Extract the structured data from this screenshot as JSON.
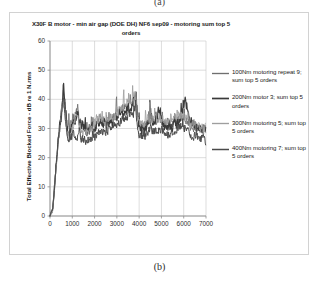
{
  "figure": {
    "caption_top": "(a)",
    "caption_bottom": "(b)"
  },
  "chart_data": {
    "type": "line",
    "title": "X30F B motor - min air gap (DOE DH) NF6 sep09 - motoring sum top 5 orders",
    "title_line1": "X30F B motor - min air gap (DOE DH) NF6 sep09 - motoring",
    "title_line2": "sum top 5 orders",
    "xlabel": "",
    "ylabel": "Total Effective Blocked Force - dB re 1 N.rms",
    "xlim": [
      0,
      7000
    ],
    "ylim": [
      0,
      60
    ],
    "xticks": [
      "0",
      "1000",
      "2000",
      "3000",
      "4000",
      "5000",
      "6000",
      "7000"
    ],
    "yticks": [
      "0",
      "10",
      "20",
      "30",
      "40",
      "50",
      "60"
    ],
    "xtick_values": [
      0,
      1000,
      2000,
      3000,
      4000,
      5000,
      6000,
      7000
    ],
    "ytick_values": [
      0,
      10,
      20,
      30,
      40,
      50,
      60
    ],
    "grid": true,
    "legend_position": "right",
    "series": [
      {
        "name": "100Nm motoring repeat 9; sum top 5 orders",
        "color": "#6f6f6f",
        "width": 0.85,
        "seed": 11,
        "baseline": [
          [
            0,
            0
          ],
          [
            120,
            2
          ],
          [
            200,
            9
          ],
          [
            260,
            16
          ],
          [
            330,
            22
          ],
          [
            420,
            29
          ],
          [
            520,
            36
          ],
          [
            600,
            43
          ],
          [
            680,
            36
          ],
          [
            780,
            31
          ],
          [
            900,
            30
          ],
          [
            1050,
            33
          ],
          [
            1200,
            36
          ],
          [
            1350,
            33
          ],
          [
            1500,
            31
          ],
          [
            1700,
            30
          ],
          [
            1900,
            31
          ],
          [
            2100,
            32
          ],
          [
            2300,
            33
          ],
          [
            2500,
            32
          ],
          [
            2700,
            33
          ],
          [
            2900,
            34
          ],
          [
            3100,
            36
          ],
          [
            3300,
            37
          ],
          [
            3500,
            38
          ],
          [
            3700,
            39
          ],
          [
            3850,
            40
          ],
          [
            3950,
            33
          ],
          [
            4100,
            30
          ],
          [
            4300,
            31
          ],
          [
            4500,
            33
          ],
          [
            4700,
            32
          ],
          [
            4900,
            33
          ],
          [
            5100,
            32
          ],
          [
            5300,
            31
          ],
          [
            5500,
            32
          ],
          [
            5700,
            33
          ],
          [
            5900,
            34
          ],
          [
            6050,
            33
          ],
          [
            6300,
            31
          ],
          [
            6600,
            30
          ],
          [
            6900,
            29
          ],
          [
            7000,
            29
          ]
        ],
        "noise": 1.5
      },
      {
        "name": "200Nm motor 3; sum top 5 orders",
        "color": "#3a3a3a",
        "width": 1.2,
        "seed": 27,
        "baseline": [
          [
            0,
            0
          ],
          [
            130,
            3
          ],
          [
            210,
            11
          ],
          [
            280,
            18
          ],
          [
            350,
            24
          ],
          [
            440,
            31
          ],
          [
            540,
            38
          ],
          [
            610,
            46
          ],
          [
            690,
            37
          ],
          [
            790,
            30
          ],
          [
            910,
            29
          ],
          [
            1060,
            32
          ],
          [
            1210,
            35
          ],
          [
            1360,
            32
          ],
          [
            1510,
            30
          ],
          [
            1710,
            29
          ],
          [
            1910,
            30
          ],
          [
            2110,
            31
          ],
          [
            2310,
            32
          ],
          [
            2510,
            31
          ],
          [
            2710,
            32
          ],
          [
            2910,
            33
          ],
          [
            3110,
            35
          ],
          [
            3310,
            36
          ],
          [
            3510,
            37
          ],
          [
            3710,
            38
          ],
          [
            3860,
            41
          ],
          [
            3960,
            32
          ],
          [
            4110,
            29
          ],
          [
            4310,
            30
          ],
          [
            4510,
            35
          ],
          [
            4710,
            31
          ],
          [
            4910,
            37
          ],
          [
            5110,
            31
          ],
          [
            5310,
            30
          ],
          [
            5510,
            31
          ],
          [
            5710,
            32
          ],
          [
            5910,
            34
          ],
          [
            6060,
            40
          ],
          [
            6310,
            32
          ],
          [
            6610,
            31
          ],
          [
            6910,
            30
          ],
          [
            7000,
            29
          ]
        ],
        "noise": 1.7
      },
      {
        "name": "300Nm motoring 5; sum top 5 orders",
        "color": "#9e9e9e",
        "width": 0.85,
        "seed": 43,
        "baseline": [
          [
            0,
            0
          ],
          [
            115,
            2
          ],
          [
            195,
            8
          ],
          [
            255,
            15
          ],
          [
            325,
            21
          ],
          [
            415,
            28
          ],
          [
            515,
            34
          ],
          [
            595,
            40
          ],
          [
            675,
            35
          ],
          [
            775,
            27
          ],
          [
            895,
            27
          ],
          [
            1045,
            31
          ],
          [
            1195,
            34
          ],
          [
            1345,
            31
          ],
          [
            1495,
            28
          ],
          [
            1695,
            28
          ],
          [
            1895,
            30
          ],
          [
            2095,
            33
          ],
          [
            2295,
            34
          ],
          [
            2495,
            32
          ],
          [
            2695,
            33
          ],
          [
            2895,
            34
          ],
          [
            3095,
            36
          ],
          [
            3295,
            38
          ],
          [
            3495,
            39
          ],
          [
            3695,
            40
          ],
          [
            3845,
            42
          ],
          [
            3945,
            34
          ],
          [
            4095,
            31
          ],
          [
            4295,
            32
          ],
          [
            4495,
            34
          ],
          [
            4695,
            33
          ],
          [
            4895,
            34
          ],
          [
            5095,
            33
          ],
          [
            5295,
            32
          ],
          [
            5495,
            33
          ],
          [
            5695,
            34
          ],
          [
            5895,
            35
          ],
          [
            6045,
            34
          ],
          [
            6295,
            32
          ],
          [
            6595,
            31
          ],
          [
            6895,
            30
          ],
          [
            7000,
            30
          ]
        ],
        "noise": 1.6
      },
      {
        "name": "400Nm motoring 7; sum top 5 orders",
        "color": "#4a4a4a",
        "width": 1.0,
        "seed": 61,
        "baseline": [
          [
            0,
            0
          ],
          [
            125,
            3
          ],
          [
            205,
            10
          ],
          [
            270,
            17
          ],
          [
            340,
            23
          ],
          [
            430,
            30
          ],
          [
            530,
            35
          ],
          [
            605,
            42
          ],
          [
            685,
            33
          ],
          [
            785,
            25
          ],
          [
            905,
            26
          ],
          [
            1055,
            28
          ],
          [
            1205,
            27
          ],
          [
            1355,
            27
          ],
          [
            1505,
            26
          ],
          [
            1705,
            26
          ],
          [
            1905,
            27
          ],
          [
            2105,
            28
          ],
          [
            2305,
            29
          ],
          [
            2505,
            29
          ],
          [
            2705,
            30
          ],
          [
            2905,
            31
          ],
          [
            3105,
            32
          ],
          [
            3305,
            33
          ],
          [
            3505,
            34
          ],
          [
            3705,
            35
          ],
          [
            3855,
            36
          ],
          [
            3955,
            28
          ],
          [
            4105,
            27
          ],
          [
            4305,
            28
          ],
          [
            4505,
            30
          ],
          [
            4705,
            29
          ],
          [
            4905,
            30
          ],
          [
            5105,
            29
          ],
          [
            5305,
            28
          ],
          [
            5505,
            29
          ],
          [
            5705,
            30
          ],
          [
            5905,
            31
          ],
          [
            6055,
            30
          ],
          [
            6305,
            28
          ],
          [
            6605,
            27
          ],
          [
            6905,
            26
          ],
          [
            7000,
            26
          ]
        ],
        "noise": 1.4
      }
    ]
  },
  "plot_geometry": {
    "left": 40,
    "top": 28,
    "width": 156,
    "height": 175
  }
}
